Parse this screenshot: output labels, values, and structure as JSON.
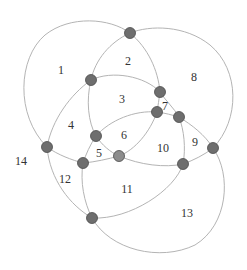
{
  "diagram": {
    "type": "circle-arrangement",
    "colors": {
      "edge": "#b4b4b4",
      "node_fill": "#6e6e6e",
      "node_fill_light": "#8c8c8c",
      "node_stroke": "#4a4a4a",
      "label": "#333333"
    },
    "regions": [
      {
        "id": "1",
        "label": "1",
        "x": 61,
        "y": 70
      },
      {
        "id": "2",
        "label": "2",
        "x": 128,
        "y": 61
      },
      {
        "id": "3",
        "label": "3",
        "x": 122,
        "y": 99
      },
      {
        "id": "4",
        "label": "4",
        "x": 71,
        "y": 125
      },
      {
        "id": "5",
        "label": "5",
        "x": 99,
        "y": 153
      },
      {
        "id": "6",
        "label": "6",
        "x": 124,
        "y": 135
      },
      {
        "id": "7",
        "label": "7",
        "x": 165,
        "y": 106
      },
      {
        "id": "8",
        "label": "8",
        "x": 194,
        "y": 77
      },
      {
        "id": "9",
        "label": "9",
        "x": 195,
        "y": 142
      },
      {
        "id": "10",
        "label": "10",
        "x": 163,
        "y": 148
      },
      {
        "id": "11",
        "label": "11",
        "x": 127,
        "y": 189
      },
      {
        "id": "12",
        "label": "12",
        "x": 65,
        "y": 179
      },
      {
        "id": "13",
        "label": "13",
        "x": 187,
        "y": 213
      },
      {
        "id": "14",
        "label": "14",
        "x": 21,
        "y": 161
      }
    ],
    "nodes": [
      {
        "id": "n1",
        "x": 130,
        "y": 33,
        "light": false
      },
      {
        "id": "n2",
        "x": 91,
        "y": 80,
        "light": false
      },
      {
        "id": "n3",
        "x": 160,
        "y": 92,
        "light": false
      },
      {
        "id": "n4",
        "x": 157,
        "y": 112,
        "light": false
      },
      {
        "id": "n5",
        "x": 179,
        "y": 117,
        "light": false
      },
      {
        "id": "n6",
        "x": 96,
        "y": 136,
        "light": false
      },
      {
        "id": "n7",
        "x": 119,
        "y": 156,
        "light": true
      },
      {
        "id": "n8",
        "x": 83,
        "y": 163,
        "light": false
      },
      {
        "id": "n9",
        "x": 47,
        "y": 147,
        "light": false
      },
      {
        "id": "n10",
        "x": 213,
        "y": 148,
        "light": false
      },
      {
        "id": "n11",
        "x": 183,
        "y": 164,
        "light": false
      },
      {
        "id": "n12",
        "x": 92,
        "y": 218,
        "light": false
      }
    ]
  }
}
